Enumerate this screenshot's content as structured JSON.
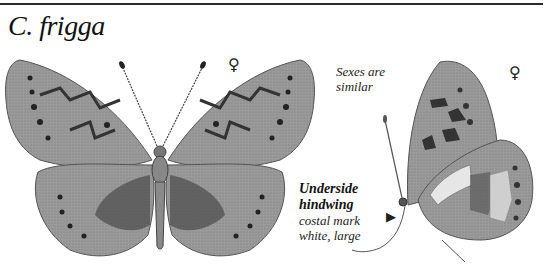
{
  "header": {
    "species_title": "C. frigga"
  },
  "figures": {
    "upperside": {
      "sex_symbol": "♀",
      "view": "upperside, wings spread"
    },
    "underside": {
      "sex_symbol": "♀",
      "view": "underside, wings closed"
    }
  },
  "annotations": {
    "sexes_note": [
      "Sexes are",
      "similar"
    ],
    "underside_note": {
      "heading": [
        "Underside",
        "hindwing"
      ],
      "detail": [
        "costal mark",
        "white, large"
      ]
    },
    "pointer_symbol": "▶"
  },
  "colors": {
    "wing_base": "#a8a8a8",
    "wing_dark": "#4a4a4a",
    "spot": "#222222",
    "pale": "#d8d8d8",
    "rule": "#2a2a2a"
  }
}
